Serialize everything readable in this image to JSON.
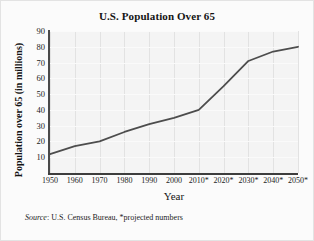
{
  "chart_data": {
    "type": "line",
    "title": "U.S. Population Over 65",
    "xlabel": "Year",
    "ylabel": "Population over 65 (in millions)",
    "x": [
      1950,
      1960,
      1970,
      1980,
      1990,
      2000,
      2010,
      2020,
      2030,
      2040,
      2050
    ],
    "categories": [
      "1950",
      "1960",
      "1970",
      "1980",
      "1990",
      "2000",
      "2010*",
      "2020*",
      "2030*",
      "2040*",
      "2050*"
    ],
    "values": [
      12,
      17,
      20,
      26,
      31,
      35,
      40,
      55,
      71,
      77,
      80
    ],
    "xlim": [
      1950,
      2050
    ],
    "ylim": [
      0,
      90
    ],
    "yticks": [
      90,
      80,
      70,
      60,
      50,
      40,
      30,
      20,
      10
    ],
    "ytick_labels": [
      "90",
      "80",
      "70",
      "60",
      "50",
      "40",
      "30",
      "20",
      "10"
    ],
    "grid": true,
    "legend": "none",
    "line_color": "#4d4d4d",
    "plot_background": "#f4f4f4",
    "series": [
      {
        "name": "Population over 65",
        "values": [
          12,
          17,
          20,
          26,
          31,
          35,
          40,
          55,
          71,
          77,
          80
        ]
      }
    ],
    "annotations": [
      "* projected numbers"
    ]
  },
  "source_note": {
    "label": "Source",
    "separator": ": ",
    "text": "U.S. Census Bureau, *projected numbers"
  }
}
